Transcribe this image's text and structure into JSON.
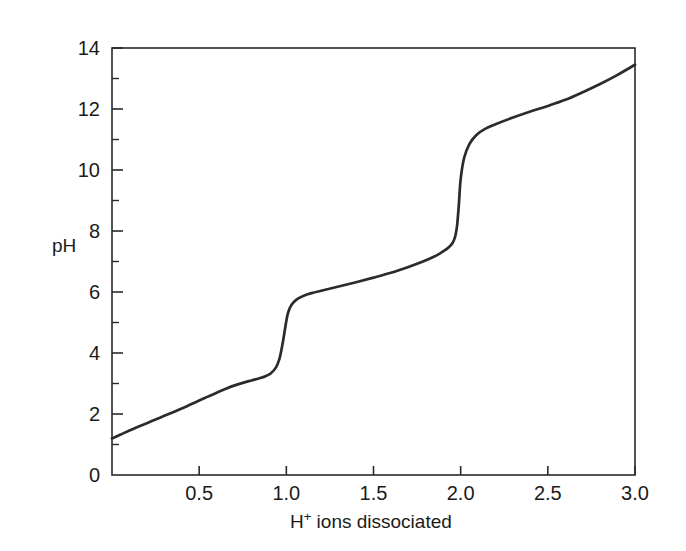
{
  "chart_data": {
    "type": "line",
    "title": "",
    "subtitle": "",
    "xlabel": "H+ ions dissociated",
    "xlabel_base": "H",
    "xlabel_sup": "+",
    "xlabel_rest": " ions dissociated",
    "ylabel": "pH",
    "xlim": [
      0,
      3.0
    ],
    "ylim": [
      0,
      14
    ],
    "grid": false,
    "legend": null,
    "legend_position": "none",
    "line_color": "#2b2b2b",
    "background_color": "#ffffff",
    "axis_color": "#2a2a2a",
    "x_ticks": [
      0,
      0.5,
      1.0,
      1.5,
      2.0,
      2.5,
      3.0
    ],
    "x_tick_labels": [
      "",
      "0.5",
      "1.0",
      "1.5",
      "2.0",
      "2.5",
      "3.0"
    ],
    "y_ticks": [
      0,
      2,
      4,
      6,
      8,
      10,
      12,
      14
    ],
    "y_tick_labels": [
      "0",
      "2",
      "4",
      "6",
      "8",
      "10",
      "12",
      "14"
    ],
    "y_minor_ticks": [
      1,
      3,
      5,
      7,
      9,
      11,
      13
    ],
    "series": [
      {
        "name": "triprotic acid titration curve",
        "x": [
          0.0,
          0.05,
          0.1,
          0.15,
          0.2,
          0.25,
          0.3,
          0.35,
          0.4,
          0.45,
          0.5,
          0.55,
          0.6,
          0.65,
          0.7,
          0.75,
          0.8,
          0.85,
          0.88,
          0.91,
          0.94,
          0.96,
          0.97,
          0.98,
          0.99,
          1.0,
          1.01,
          1.03,
          1.06,
          1.1,
          1.15,
          1.2,
          1.3,
          1.4,
          1.5,
          1.6,
          1.7,
          1.78,
          1.84,
          1.88,
          1.91,
          1.93,
          1.95,
          1.96,
          1.97,
          1.98,
          1.99,
          2.0,
          2.02,
          2.05,
          2.09,
          2.14,
          2.2,
          2.3,
          2.4,
          2.5,
          2.6,
          2.7,
          2.8,
          2.9,
          3.0
        ],
        "y": [
          1.2,
          1.33,
          1.46,
          1.58,
          1.7,
          1.82,
          1.94,
          2.06,
          2.18,
          2.31,
          2.44,
          2.57,
          2.7,
          2.82,
          2.93,
          3.02,
          3.1,
          3.18,
          3.24,
          3.33,
          3.52,
          3.8,
          4.05,
          4.35,
          4.7,
          5.05,
          5.32,
          5.58,
          5.76,
          5.88,
          5.97,
          6.04,
          6.18,
          6.32,
          6.47,
          6.63,
          6.82,
          6.99,
          7.14,
          7.26,
          7.37,
          7.46,
          7.58,
          7.68,
          7.85,
          8.2,
          8.9,
          9.7,
          10.4,
          10.85,
          11.15,
          11.35,
          11.5,
          11.72,
          11.92,
          12.1,
          12.3,
          12.55,
          12.82,
          13.12,
          13.45
        ]
      }
    ],
    "annotations": [
      {
        "label": "first equivalence point",
        "x": 1.0,
        "y": 5.0
      },
      {
        "label": "second equivalence point",
        "x": 2.0,
        "y": 9.7
      }
    ]
  }
}
